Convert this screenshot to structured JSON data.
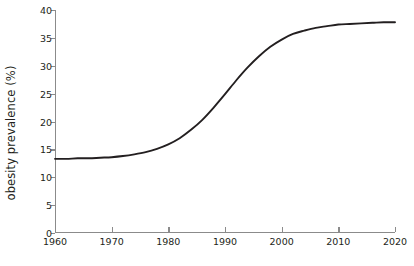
{
  "chart_data": {
    "type": "line",
    "title": "",
    "subtitle": "",
    "xlabel": "",
    "ylabel": "obesity prevalence (%)",
    "xlim": [
      1960,
      2020
    ],
    "ylim": [
      0,
      40
    ],
    "grid": false,
    "legend": false,
    "legend_position": "none",
    "xticks": [
      1960,
      1970,
      1980,
      1990,
      2000,
      2010,
      2020
    ],
    "xtick_labels": [
      "1960",
      "1970",
      "1980",
      "1990",
      "2000",
      "2010",
      "2020"
    ],
    "yticks": [
      0,
      5,
      10,
      15,
      20,
      25,
      30,
      35,
      40
    ],
    "ytick_labels": [
      "0",
      "5",
      "10",
      "15",
      "20",
      "25",
      "30",
      "35",
      "40"
    ],
    "line_color": "#231f20",
    "line_width": 1.9,
    "axis_color": "#8b8b8b",
    "background_color": "#ffffff",
    "annotations": [],
    "series": [
      {
        "name": "obesity prevalence",
        "x": [
          1960,
          1962,
          1964,
          1966,
          1968,
          1970,
          1972,
          1974,
          1976,
          1978,
          1980,
          1982,
          1984,
          1986,
          1988,
          1990,
          1992,
          1994,
          1996,
          1998,
          2000,
          2002,
          2004,
          2006,
          2008,
          2010,
          2012,
          2014,
          2016,
          2018,
          2020
        ],
        "values": [
          13.3,
          13.3,
          13.4,
          13.4,
          13.5,
          13.6,
          13.8,
          14.1,
          14.5,
          15.1,
          15.9,
          17.0,
          18.5,
          20.3,
          22.5,
          24.9,
          27.4,
          29.7,
          31.7,
          33.4,
          34.7,
          35.7,
          36.3,
          36.8,
          37.1,
          37.4,
          37.5,
          37.6,
          37.7,
          37.8,
          37.8
        ]
      }
    ]
  }
}
